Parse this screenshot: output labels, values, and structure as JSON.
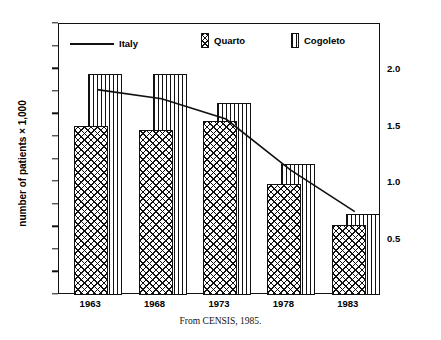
{
  "chart_data": {
    "type": "bar",
    "title": "",
    "categories": [
      "1963",
      "1968",
      "1973",
      "1978",
      "1983"
    ],
    "series": [
      {
        "name": "Quarto",
        "values": [
          75,
          73,
          77,
          49,
          31
        ],
        "axis": "left",
        "pattern": "cross-hatch"
      },
      {
        "name": "Cogoleto",
        "values": [
          98,
          98,
          85,
          58,
          36
        ],
        "axis": "left",
        "pattern": "vertical-lines"
      },
      {
        "name": "Italy",
        "values": [
          1.81,
          1.73,
          1.55,
          1.1,
          0.73
        ],
        "axis": "right",
        "pattern": "line"
      }
    ],
    "xlabel": "",
    "ylabel": "number of patients × 1,000",
    "ylabel_right": "",
    "ylim": [
      0,
      120
    ],
    "yticks": [
      0,
      10,
      20,
      30,
      40,
      50,
      60,
      70,
      80,
      90,
      100,
      110,
      120
    ],
    "ylim_right": [
      0,
      2.4
    ],
    "yticks_right": [
      0.5,
      1.0,
      1.5,
      2.0
    ],
    "grid": false,
    "legend_position": "top-inside",
    "caption": "From CENSIS, 1985."
  },
  "axes": {
    "y_left": {
      "title": "number of patients × 1,000",
      "ticks": [
        "120",
        "110",
        "100",
        "90",
        "80",
        "70",
        "60",
        "50",
        "40",
        "30",
        "20",
        "10",
        "0"
      ]
    },
    "y_right": {
      "ticks": [
        "2.0",
        "1.5",
        "1.0",
        "0.5"
      ]
    },
    "x": {
      "ticks": [
        "1963",
        "1968",
        "1973",
        "1978",
        "1983"
      ]
    }
  },
  "legend": {
    "items": [
      {
        "label": "Italy",
        "swatch": "line-swatch"
      },
      {
        "label": "Quarto",
        "swatch": "cross-hatch-swatch"
      },
      {
        "label": "Cogoleto",
        "swatch": "vertical-lines-swatch"
      }
    ]
  },
  "caption": {
    "text": "From CENSIS, 1985."
  },
  "colors": {
    "ink": "#111111",
    "background": "#ffffff"
  }
}
